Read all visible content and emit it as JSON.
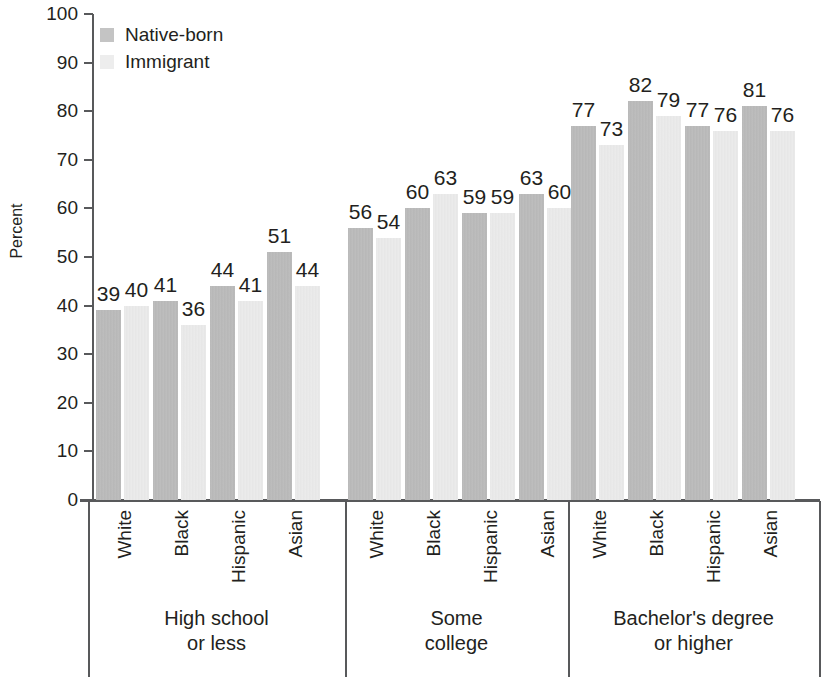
{
  "chart_data": {
    "type": "bar",
    "title": "",
    "xlabel": "",
    "ylabel": "Percent",
    "ylim": [
      0,
      100
    ],
    "ytick_step": 10,
    "yticks": [
      0,
      10,
      20,
      30,
      40,
      50,
      60,
      70,
      80,
      90,
      100
    ],
    "ytick_labels": [
      "0",
      "10",
      "20",
      "30",
      "40",
      "50",
      "60",
      "70",
      "80",
      "90",
      "100"
    ],
    "grid": false,
    "legend_position": "top-left",
    "group_labels": [
      "High school\nor less",
      "Some\ncollege",
      "Bachelor's degree\nor higher"
    ],
    "groups": [
      {
        "label_line1": "High school",
        "label_line2": "or less",
        "categories": [
          "White",
          "Black",
          "Hispanic",
          "Asian"
        ],
        "native_born": [
          39,
          41,
          44,
          51
        ],
        "immigrant": [
          40,
          36,
          41,
          44
        ]
      },
      {
        "label_line1": "Some",
        "label_line2": "college",
        "categories": [
          "White",
          "Black",
          "Hispanic",
          "Asian"
        ],
        "native_born": [
          56,
          60,
          59,
          63
        ],
        "immigrant": [
          54,
          63,
          59,
          60
        ]
      },
      {
        "label_line1": "Bachelor's degree",
        "label_line2": "or higher",
        "categories": [
          "White",
          "Black",
          "Hispanic",
          "Asian"
        ],
        "native_born": [
          77,
          82,
          77,
          81
        ],
        "immigrant": [
          73,
          79,
          76,
          76
        ]
      }
    ],
    "series": [
      {
        "name": "Native-born",
        "color": "#b8b8b8",
        "values": [
          39,
          41,
          44,
          51,
          56,
          60,
          59,
          63,
          77,
          82,
          77,
          81
        ]
      },
      {
        "name": "Immigrant",
        "color": "#e9e9e9",
        "values": [
          40,
          36,
          41,
          44,
          54,
          63,
          59,
          60,
          73,
          79,
          76,
          76
        ]
      }
    ],
    "categories": [
      "High school or less - White",
      "High school or less - Black",
      "High school or less - Hispanic",
      "High school or less - Asian",
      "Some college - White",
      "Some college - Black",
      "Some college - Hispanic",
      "Some college - Asian",
      "Bachelor's degree or higher - White",
      "Bachelor's degree or higher - Black",
      "Bachelor's degree or higher - Hispanic",
      "Bachelor's degree or higher - Asian"
    ]
  },
  "legend": {
    "items": [
      {
        "label": "Native-born",
        "color": "#b8b8b8"
      },
      {
        "label": "Immigrant",
        "color": "#e9e9e9"
      }
    ]
  },
  "axis": {
    "y_title": "Percent"
  }
}
